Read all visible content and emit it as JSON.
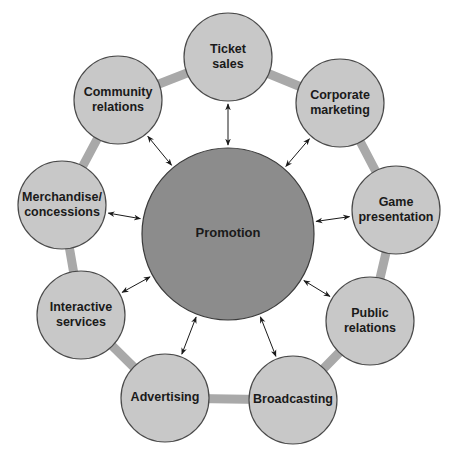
{
  "colors": {
    "background": "#ffffff",
    "ring": "#a9a9a9",
    "node_fill": "#c8c8c8",
    "node_stroke": "#4a4a4a",
    "center_fill": "#8c8c8c",
    "center_stroke": "#3a3a3a",
    "arrow": "#1a1a1a",
    "text": "#1a1a1a"
  },
  "center": {
    "label": "Promotion",
    "cx": 228,
    "cy": 234,
    "r": 86
  },
  "ring": {
    "cx": 228,
    "cy": 230,
    "r": 176
  },
  "nodes": [
    {
      "id": "ticket-sales",
      "lines": [
        "Ticket",
        "sales"
      ],
      "cx": 228,
      "cy": 57,
      "r": 44
    },
    {
      "id": "corporate-marketing",
      "lines": [
        "Corporate",
        "marketing"
      ],
      "cx": 340,
      "cy": 103,
      "r": 44
    },
    {
      "id": "game-presentation",
      "lines": [
        "Game",
        "presentation"
      ],
      "cx": 396,
      "cy": 210,
      "r": 44
    },
    {
      "id": "public-relations",
      "lines": [
        "Public",
        "relations"
      ],
      "cx": 370,
      "cy": 321,
      "r": 44
    },
    {
      "id": "broadcasting",
      "lines": [
        "Broadcasting"
      ],
      "cx": 293,
      "cy": 400,
      "r": 44
    },
    {
      "id": "advertising",
      "lines": [
        "Advertising"
      ],
      "cx": 165,
      "cy": 398,
      "r": 44
    },
    {
      "id": "interactive-services",
      "lines": [
        "Interactive",
        "services"
      ],
      "cx": 81,
      "cy": 315,
      "r": 44
    },
    {
      "id": "merchandise-concessions",
      "lines": [
        "Merchandise/",
        "concessions"
      ],
      "cx": 62,
      "cy": 205,
      "r": 44
    },
    {
      "id": "community-relations",
      "lines": [
        "Community",
        "relations"
      ],
      "cx": 118,
      "cy": 100,
      "r": 44
    }
  ]
}
